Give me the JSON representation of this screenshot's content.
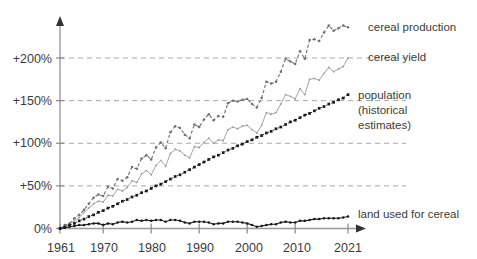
{
  "chart_data": {
    "type": "line",
    "title": "",
    "subtitle": "",
    "xlabel": "",
    "ylabel": "",
    "xlim": [
      1961,
      2021
    ],
    "ylim": [
      -8,
      245
    ],
    "grid": true,
    "grid_style": "dashed horizontal",
    "legend_position": "right-inline",
    "x_ticks": [
      1961,
      1970,
      1980,
      1990,
      2000,
      2010,
      2021
    ],
    "x_tick_labels": [
      "1961",
      "1970",
      "1980",
      "1990",
      "2000",
      "2010",
      "2021"
    ],
    "y_ticks": [
      0,
      50,
      100,
      150,
      200
    ],
    "y_tick_labels": [
      "0%",
      "+50%",
      "+100%",
      "+150%",
      "+200%"
    ],
    "axis_color": "#9a9a9a",
    "grid_color": "#a8a8a8",
    "series": [
      {
        "name": "cereal production",
        "label": "cereal production",
        "color": "#6f6f6f",
        "style": "dashed",
        "marker": "dot",
        "label_x": 368,
        "label_y": 31,
        "x": [
          1961,
          1962,
          1963,
          1964,
          1965,
          1966,
          1967,
          1968,
          1969,
          1970,
          1971,
          1972,
          1973,
          1974,
          1975,
          1976,
          1977,
          1978,
          1979,
          1980,
          1981,
          1982,
          1983,
          1984,
          1985,
          1986,
          1987,
          1988,
          1989,
          1990,
          1991,
          1992,
          1993,
          1994,
          1995,
          1996,
          1997,
          1998,
          1999,
          2000,
          2001,
          2002,
          2003,
          2004,
          2005,
          2006,
          2007,
          2008,
          2009,
          2010,
          2011,
          2012,
          2013,
          2014,
          2015,
          2016,
          2017,
          2018,
          2019,
          2020,
          2021
        ],
        "values": [
          0,
          4,
          6,
          12,
          16,
          22,
          29,
          36,
          40,
          38,
          49,
          47,
          58,
          56,
          60,
          72,
          70,
          82,
          86,
          81,
          95,
          101,
          94,
          113,
          120,
          118,
          110,
          106,
          122,
          119,
          128,
          134,
          127,
          132,
          131,
          147,
          150,
          149,
          151,
          152,
          146,
          142,
          153,
          172,
          170,
          172,
          184,
          199,
          196,
          193,
          208,
          199,
          221,
          222,
          220,
          230,
          238,
          232,
          235,
          238,
          236
        ]
      },
      {
        "name": "cereal yield",
        "label": "cereal yield",
        "color": "#9a9a9a",
        "style": "solid",
        "marker": "dot",
        "label_x": 368,
        "label_y": 57,
        "x": [
          1961,
          1962,
          1963,
          1964,
          1965,
          1966,
          1967,
          1968,
          1969,
          1970,
          1971,
          1972,
          1973,
          1974,
          1975,
          1976,
          1977,
          1978,
          1979,
          1980,
          1981,
          1982,
          1983,
          1984,
          1985,
          1986,
          1987,
          1988,
          1989,
          1990,
          1991,
          1992,
          1993,
          1994,
          1995,
          1996,
          1997,
          1998,
          1999,
          2000,
          2001,
          2002,
          2003,
          2004,
          2005,
          2006,
          2007,
          2008,
          2009,
          2010,
          2011,
          2012,
          2013,
          2014,
          2015,
          2016,
          2017,
          2018,
          2019,
          2020,
          2021
        ],
        "values": [
          0,
          3,
          5,
          9,
          13,
          19,
          24,
          29,
          32,
          31,
          39,
          38,
          46,
          44,
          48,
          56,
          54,
          64,
          68,
          63,
          74,
          80,
          73,
          88,
          93,
          91,
          86,
          83,
          96,
          95,
          101,
          106,
          100,
          104,
          103,
          116,
          119,
          117,
          120,
          121,
          116,
          112,
          121,
          136,
          134,
          136,
          146,
          157,
          155,
          152,
          164,
          157,
          175,
          176,
          174,
          182,
          189,
          184,
          187,
          190,
          200
        ]
      },
      {
        "name": "population (historical estimates)",
        "label_lines": [
          "population",
          "(historical",
          "estimates)"
        ],
        "color": "#1a1a1a",
        "style": "dotted-markers",
        "marker": "square",
        "label_x": 358,
        "label_y": 97,
        "x": [
          1961,
          1962,
          1963,
          1964,
          1965,
          1966,
          1967,
          1968,
          1969,
          1970,
          1971,
          1972,
          1973,
          1974,
          1975,
          1976,
          1977,
          1978,
          1979,
          1980,
          1981,
          1982,
          1983,
          1984,
          1985,
          1986,
          1987,
          1988,
          1989,
          1990,
          1991,
          1992,
          1993,
          1994,
          1995,
          1996,
          1997,
          1998,
          1999,
          2000,
          2001,
          2002,
          2003,
          2004,
          2005,
          2006,
          2007,
          2008,
          2009,
          2010,
          2011,
          2012,
          2013,
          2014,
          2015,
          2016,
          2017,
          2018,
          2019,
          2020,
          2021
        ],
        "values": [
          0,
          2,
          4,
          6,
          9,
          11,
          14,
          16,
          19,
          21,
          24,
          26,
          29,
          32,
          34,
          37,
          39,
          42,
          44,
          47,
          50,
          52,
          55,
          58,
          61,
          63,
          66,
          69,
          72,
          75,
          78,
          81,
          84,
          86,
          89,
          92,
          94,
          97,
          99,
          102,
          104,
          107,
          109,
          112,
          114,
          117,
          119,
          122,
          125,
          127,
          130,
          133,
          135,
          138,
          141,
          143,
          146,
          148,
          151,
          153,
          157
        ]
      },
      {
        "name": "land used for cereal",
        "label": "land used for cereal",
        "color": "#1a1a1a",
        "style": "solid",
        "marker": "dot",
        "label_x": 358,
        "label_y": 214,
        "x": [
          1961,
          1962,
          1963,
          1964,
          1965,
          1966,
          1967,
          1968,
          1969,
          1970,
          1971,
          1972,
          1973,
          1974,
          1975,
          1976,
          1977,
          1978,
          1979,
          1980,
          1981,
          1982,
          1983,
          1984,
          1985,
          1986,
          1987,
          1988,
          1989,
          1990,
          1991,
          1992,
          1993,
          1994,
          1995,
          1996,
          1997,
          1998,
          1999,
          2000,
          2001,
          2002,
          2003,
          2004,
          2005,
          2006,
          2007,
          2008,
          2009,
          2010,
          2011,
          2012,
          2013,
          2014,
          2015,
          2016,
          2017,
          2018,
          2019,
          2020,
          2021
        ],
        "values": [
          0,
          1,
          2,
          3,
          4,
          4,
          5,
          6,
          6,
          4,
          6,
          5,
          7,
          8,
          7,
          8,
          10,
          9,
          10,
          9,
          10,
          10,
          8,
          10,
          10,
          9,
          7,
          6,
          8,
          8,
          8,
          7,
          5,
          6,
          6,
          8,
          8,
          8,
          7,
          6,
          4,
          2,
          3,
          4,
          5,
          5,
          7,
          8,
          7,
          7,
          9,
          9,
          10,
          11,
          11,
          12,
          12,
          12,
          12,
          13,
          14
        ]
      }
    ]
  },
  "legend": {
    "cereal_production": "cereal production",
    "cereal_yield": "cereal yield",
    "population_line1": "population",
    "population_line2": "(historical",
    "population_line3": "estimates)",
    "land_used": "land used for cereal"
  },
  "axis": {
    "y0": "0%",
    "y50": "+50%",
    "y100": "+100%",
    "y150": "+150%",
    "y200": "+200%",
    "x1961": "1961",
    "x1970": "1970",
    "x1980": "1980",
    "x1990": "1990",
    "x2000": "2000",
    "x2010": "2010",
    "x2021": "2021"
  }
}
